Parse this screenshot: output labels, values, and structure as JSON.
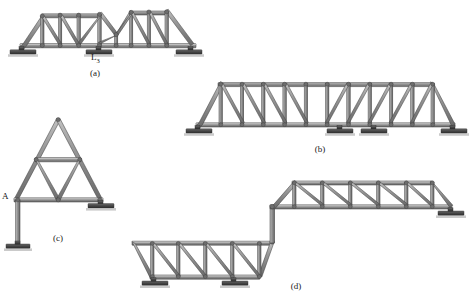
{
  "figure": {
    "background_color": "#ffffff",
    "member_fill": "#8f8f8f",
    "member_fill_light": "#b2b2b2",
    "member_fill_dark": "#6d6d6d",
    "member_stroke": "#3a3a3a",
    "support_color": "#4a4a4a",
    "support_shadow": "#9a9a9a",
    "text_color": "#1a1a1a"
  },
  "captions": {
    "a": "(a)",
    "b": "(b)",
    "c": "(c)",
    "d": "(d)"
  },
  "labels": {
    "l3_main": "L",
    "l3_sub": "3",
    "a_joint": "A"
  },
  "trusses": [
    {
      "id": "a",
      "name": "continuous-parker-truss",
      "caption": "(a)",
      "span_panels": 8,
      "supports": 3,
      "joint_labels": [
        "L3"
      ],
      "description": "Two-span continuous truss with polygonal top chord and diagonal web members"
    },
    {
      "id": "b",
      "name": "long-pratt-truss",
      "caption": "(b)",
      "span_panels": 10,
      "supports": 4,
      "joint_labels": [],
      "description": "Long Pratt through truss with inclined end posts and four bearing supports"
    },
    {
      "id": "c",
      "name": "fink-gable-truss",
      "caption": "(c)",
      "span_panels": 2,
      "supports": 2,
      "joint_labels": [
        "A"
      ],
      "description": "Triangular gable Fink truss on a column leg at joint A and a roller support"
    },
    {
      "id": "d",
      "name": "stepped-offset-truss",
      "caption": "(d)",
      "span_panels": 9,
      "supports": 3,
      "joint_labels": [],
      "description": "Offset stepped truss: lower-left Pratt span connected by a vertical riser to an upper-right Pratt span"
    }
  ]
}
